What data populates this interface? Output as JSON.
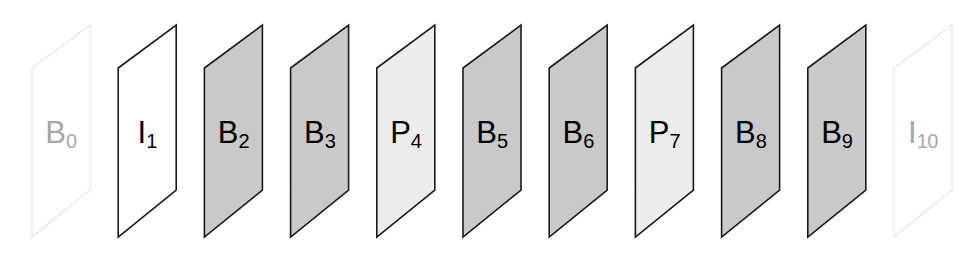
{
  "diagram": {
    "canvas": {
      "width": 979,
      "height": 255
    },
    "geometry": {
      "pitch": 86.2,
      "first_top_right_x": 90,
      "skew_dx": -58,
      "top_y": 25,
      "bottom_y": 237,
      "right_edge_top_y": 25,
      "right_edge_bottom_y": 190,
      "left_edge_top_y": 68,
      "left_edge_bottom_y": 237
    },
    "styles": {
      "B_fill": "#c9c9c9",
      "P_fill": "#ececec",
      "I_fill": "#ffffff",
      "stroke_dark": "#1a1a1a",
      "stroke_faint": "#e2e2e2",
      "label_dark": "#000000",
      "label_faint": "#a8a8a8",
      "stroke_width": 1.6,
      "stroke_width_faint": 1.1
    },
    "frames": [
      {
        "name": "frame-b0",
        "type": "B",
        "letter": "B",
        "index": "0",
        "fill": "#ffffff",
        "stroke": "#e2e2e2",
        "stroke_width": 1.1,
        "label_color": "#a8a8a8",
        "faded": true
      },
      {
        "name": "frame-i1",
        "type": "I",
        "letter": "I",
        "index": "1",
        "fill": "#ffffff",
        "stroke": "#1a1a1a",
        "stroke_width": 1.6,
        "label_color": "#000000",
        "faded": false
      },
      {
        "name": "frame-b2",
        "type": "B",
        "letter": "B",
        "index": "2",
        "fill": "#c9c9c9",
        "stroke": "#1a1a1a",
        "stroke_width": 1.6,
        "label_color": "#000000",
        "faded": false
      },
      {
        "name": "frame-b3",
        "type": "B",
        "letter": "B",
        "index": "3",
        "fill": "#c9c9c9",
        "stroke": "#1a1a1a",
        "stroke_width": 1.6,
        "label_color": "#000000",
        "faded": false
      },
      {
        "name": "frame-p4",
        "type": "P",
        "letter": "P",
        "index": "4",
        "fill": "#ececec",
        "stroke": "#1a1a1a",
        "stroke_width": 1.6,
        "label_color": "#000000",
        "faded": false
      },
      {
        "name": "frame-b5",
        "type": "B",
        "letter": "B",
        "index": "5",
        "fill": "#c9c9c9",
        "stroke": "#1a1a1a",
        "stroke_width": 1.6,
        "label_color": "#000000",
        "faded": false
      },
      {
        "name": "frame-b6",
        "type": "B",
        "letter": "B",
        "index": "6",
        "fill": "#c9c9c9",
        "stroke": "#1a1a1a",
        "stroke_width": 1.6,
        "label_color": "#000000",
        "faded": false
      },
      {
        "name": "frame-p7",
        "type": "P",
        "letter": "P",
        "index": "7",
        "fill": "#ececec",
        "stroke": "#1a1a1a",
        "stroke_width": 1.6,
        "label_color": "#000000",
        "faded": false
      },
      {
        "name": "frame-b8",
        "type": "B",
        "letter": "B",
        "index": "8",
        "fill": "#c9c9c9",
        "stroke": "#1a1a1a",
        "stroke_width": 1.6,
        "label_color": "#000000",
        "faded": false
      },
      {
        "name": "frame-b9",
        "type": "B",
        "letter": "B",
        "index": "9",
        "fill": "#c9c9c9",
        "stroke": "#1a1a1a",
        "stroke_width": 1.6,
        "label_color": "#000000",
        "faded": false
      },
      {
        "name": "frame-i10",
        "type": "I",
        "letter": "I",
        "index": "10",
        "fill": "#ffffff",
        "stroke": "#e2e2e2",
        "stroke_width": 1.1,
        "label_color": "#a8a8a8",
        "faded": true
      }
    ]
  }
}
